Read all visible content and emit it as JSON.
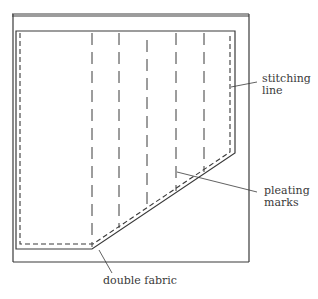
{
  "diagram": {
    "colors": {
      "line": "#3a3a3a",
      "background": "#ffffff"
    },
    "outer_fabric": {
      "x1": 12,
      "y1": 14,
      "x2": 249,
      "y2": 262
    },
    "inner_piece": {
      "points": "16,31 235,31 235,153 92,249 16,249"
    },
    "stitching_line": {
      "points": "20,33 230,33 230,152 93,244 20,244"
    },
    "pleating_marks_x": [
      92,
      119,
      147,
      176,
      204
    ],
    "pleating_marks_bottom_y": [
      247,
      228,
      210,
      191,
      172
    ],
    "labels": {
      "stitching_line_1": "stitching",
      "stitching_line_2": "line",
      "pleating_marks_1": "pleating",
      "pleating_marks_2": "marks",
      "double_fabric": "double fabric"
    }
  }
}
